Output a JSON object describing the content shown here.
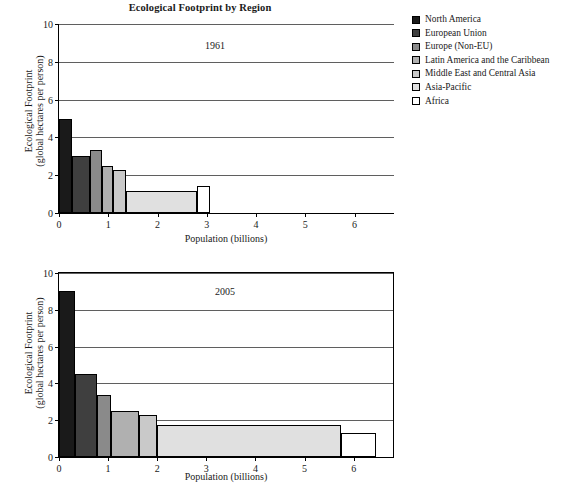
{
  "chart_data": {
    "type": "bar",
    "title": "Ecological Footprint by Region",
    "xlabel": "Population (billions)",
    "ylabel_line1": "Ecological Footprint",
    "ylabel_line2": "(global hectares per person)",
    "note": "Width of each bar is the region's population; height is its ecological footprint per person.",
    "xlim": [
      0,
      6.8
    ],
    "ylim": [
      0,
      10
    ],
    "xticks": [
      0,
      1,
      2,
      3,
      4,
      5,
      6
    ],
    "yticks": [
      0,
      2,
      4,
      6,
      8,
      10
    ],
    "grid": "horizontal",
    "legend_position": "right",
    "legend": [
      {
        "label": "North America",
        "color": "#1a1a1a"
      },
      {
        "label": "European Union",
        "color": "#3f3f3f"
      },
      {
        "label": "Europe (Non-EU)",
        "color": "#8a8a8a"
      },
      {
        "label": "Latin America and the Caribbean",
        "color": "#b0b0b0"
      },
      {
        "label": "Middle East and Central Asia",
        "color": "#c9c9c9"
      },
      {
        "label": "Asia-Pacific",
        "color": "#e0e0e0"
      },
      {
        "label": "Africa",
        "color": "#ffffff"
      }
    ],
    "panels": [
      {
        "year": "1961",
        "xticks": [
          0,
          1,
          2,
          3,
          4,
          5,
          6
        ],
        "yticks": [
          0,
          2,
          4,
          6,
          8,
          10
        ],
        "bars": [
          {
            "region": "North America",
            "x_start": 0.0,
            "x_end": 0.27,
            "population": 0.27,
            "footprint": 5.0,
            "color": "#1a1a1a"
          },
          {
            "region": "European Union",
            "x_start": 0.27,
            "x_end": 0.62,
            "population": 0.35,
            "footprint": 3.0,
            "color": "#3f3f3f"
          },
          {
            "region": "Europe (Non-EU)",
            "x_start": 0.62,
            "x_end": 0.87,
            "population": 0.25,
            "footprint": 3.35,
            "color": "#8a8a8a"
          },
          {
            "region": "Latin America and the Caribbean",
            "x_start": 0.87,
            "x_end": 1.1,
            "population": 0.23,
            "footprint": 2.5,
            "color": "#b0b0b0"
          },
          {
            "region": "Middle East and Central Asia",
            "x_start": 1.1,
            "x_end": 1.35,
            "population": 0.25,
            "footprint": 2.25,
            "color": "#c9c9c9"
          },
          {
            "region": "Asia-Pacific",
            "x_start": 1.35,
            "x_end": 2.8,
            "population": 1.45,
            "footprint": 1.15,
            "color": "#e0e0e0"
          },
          {
            "region": "Africa",
            "x_start": 2.8,
            "x_end": 3.07,
            "population": 0.27,
            "footprint": 1.45,
            "color": "#ffffff"
          }
        ]
      },
      {
        "year": "2005",
        "xticks": [
          0,
          1,
          2,
          3,
          4,
          5,
          6
        ],
        "yticks": [
          0,
          2,
          4,
          6,
          8,
          10
        ],
        "bars": [
          {
            "region": "North America",
            "x_start": 0.0,
            "x_end": 0.33,
            "population": 0.33,
            "footprint": 9.0,
            "color": "#1a1a1a"
          },
          {
            "region": "European Union",
            "x_start": 0.33,
            "x_end": 0.78,
            "population": 0.45,
            "footprint": 4.5,
            "color": "#3f3f3f"
          },
          {
            "region": "Europe (Non-EU)",
            "x_start": 0.78,
            "x_end": 1.05,
            "population": 0.27,
            "footprint": 3.35,
            "color": "#8a8a8a"
          },
          {
            "region": "Latin America and the Caribbean",
            "x_start": 1.05,
            "x_end": 1.62,
            "population": 0.57,
            "footprint": 2.5,
            "color": "#b0b0b0"
          },
          {
            "region": "Middle East and Central Asia",
            "x_start": 1.62,
            "x_end": 2.0,
            "population": 0.38,
            "footprint": 2.3,
            "color": "#c9c9c9"
          },
          {
            "region": "Asia-Pacific",
            "x_start": 2.0,
            "x_end": 5.75,
            "population": 3.75,
            "footprint": 1.75,
            "color": "#e0e0e0"
          },
          {
            "region": "Africa",
            "x_start": 5.75,
            "x_end": 6.45,
            "population": 0.7,
            "footprint": 1.3,
            "color": "#ffffff"
          }
        ]
      }
    ]
  }
}
